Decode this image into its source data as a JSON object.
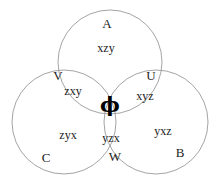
{
  "diagram": {
    "background_color": "#ffffff",
    "stroke_color": "#9a9a9a",
    "text_color": "#1c1c1c",
    "circles": [
      {
        "id": "A",
        "label": "A",
        "cx": 110,
        "cy": 62,
        "r": 52
      },
      {
        "id": "C",
        "label": "C",
        "cx": 64,
        "cy": 122,
        "r": 52
      },
      {
        "id": "B",
        "label": "B",
        "cx": 156,
        "cy": 122,
        "r": 52
      }
    ],
    "set_labels": {
      "a": "A",
      "b": "B",
      "c": "C",
      "u": "U",
      "v": "V",
      "w": "W"
    },
    "region_contents": {
      "a_only": "xzy",
      "c_only": "zyx",
      "b_only": "yxz",
      "a_and_c": "zxy",
      "a_and_b": "xyz",
      "b_and_c": "yzx",
      "center": "ϕ"
    }
  }
}
